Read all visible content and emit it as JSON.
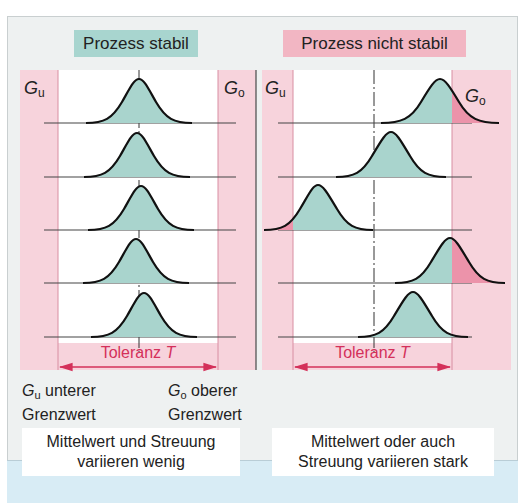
{
  "panels": [
    {
      "id": "stable",
      "title": "Prozess stabil",
      "title_bg": "#a8d5cf",
      "lower_limit_symbol": "G",
      "lower_limit_sub": "u",
      "upper_limit_symbol": "G",
      "upper_limit_sub": "o",
      "tolerance_label": "Toleranz",
      "tolerance_symbol": "T",
      "caption_line1": "Mittelwert und Streuung",
      "caption_line2": "variieren wenig"
    },
    {
      "id": "unstable",
      "title": "Prozess nicht stabil",
      "title_bg": "#f2b6c3",
      "lower_limit_symbol": "G",
      "lower_limit_sub": "u",
      "upper_limit_symbol": "G",
      "upper_limit_sub": "o",
      "tolerance_label": "Toleranz",
      "tolerance_symbol": "T",
      "caption_line1": "Mittelwert oder auch",
      "caption_line2": "Streuung variieren stark"
    }
  ],
  "legend": {
    "lower_symbol": "G",
    "lower_sub": "u",
    "lower_text_1": " unterer",
    "lower_text_2": "Grenzwert",
    "upper_symbol": "G",
    "upper_sub": "o",
    "upper_text_1": " oberer",
    "upper_text_2": "Grenzwert"
  },
  "colors": {
    "pink_zone": "#f7d3dc",
    "teal_fill": "#a9d4cd",
    "out_of_tolerance_fill": "#ec93aa",
    "accent_red": "#d4305a",
    "frame_bg": "#eef1f1",
    "bottom_band": "#d8ecf5"
  }
}
